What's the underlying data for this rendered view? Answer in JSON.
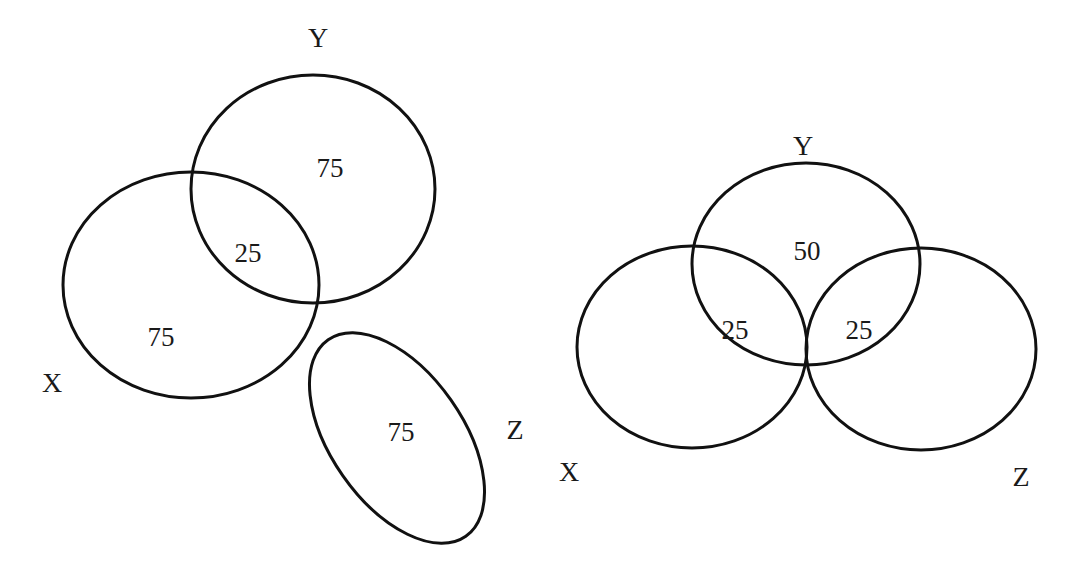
{
  "diagrams": [
    {
      "id": "left",
      "sets": [
        {
          "label": "Y",
          "shape": "ellipse",
          "cx": 313,
          "cy": 189,
          "rx": 122,
          "ry": 114,
          "rotate": 0,
          "label_x": 318,
          "label_y": 38
        },
        {
          "label": "X",
          "shape": "ellipse",
          "cx": 191,
          "cy": 285,
          "rx": 128,
          "ry": 113,
          "rotate": 0,
          "label_x": 52,
          "label_y": 383
        },
        {
          "label": "Z",
          "shape": "ellipse",
          "cx": 397,
          "cy": 438,
          "rx": 120,
          "ry": 66,
          "rotate": 55,
          "label_x": 515,
          "label_y": 430
        }
      ],
      "regions": [
        {
          "sets": "Y only",
          "value": "75",
          "x": 330,
          "y": 168
        },
        {
          "sets": "X∩Y",
          "value": "25",
          "x": 248,
          "y": 253
        },
        {
          "sets": "X only",
          "value": "75",
          "x": 161,
          "y": 337
        },
        {
          "sets": "Z only",
          "value": "75",
          "x": 401,
          "y": 432
        }
      ]
    },
    {
      "id": "right",
      "sets": [
        {
          "label": "Y",
          "shape": "ellipse",
          "cx": 806,
          "cy": 264,
          "rx": 114,
          "ry": 101,
          "rotate": 0,
          "label_x": 803,
          "label_y": 146
        },
        {
          "label": "X",
          "shape": "ellipse",
          "cx": 692,
          "cy": 347,
          "rx": 115,
          "ry": 101,
          "rotate": 0,
          "label_x": 569,
          "label_y": 472
        },
        {
          "label": "Z",
          "shape": "ellipse",
          "cx": 921,
          "cy": 349,
          "rx": 115,
          "ry": 101,
          "rotate": 0,
          "label_x": 1021,
          "label_y": 477
        }
      ],
      "regions": [
        {
          "sets": "Y only",
          "value": "50",
          "x": 807,
          "y": 251
        },
        {
          "sets": "X∩Y",
          "value": "25",
          "x": 735,
          "y": 330
        },
        {
          "sets": "Y∩Z",
          "value": "25",
          "x": 859,
          "y": 330
        }
      ]
    }
  ],
  "style": {
    "stroke": "#111111",
    "background": "#ffffff",
    "text": "#1a1a1a"
  }
}
